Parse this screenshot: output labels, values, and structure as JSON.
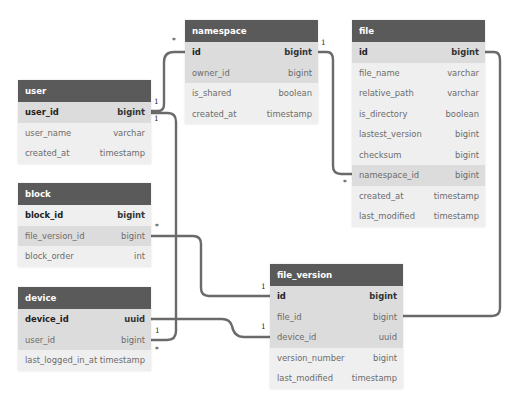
{
  "tables": {
    "user": {
      "title": "user",
      "columns": [
        {
          "name": "user_id",
          "type": "bigint"
        },
        {
          "name": "user_name",
          "type": "varchar"
        },
        {
          "name": "created_at",
          "type": "timestamp"
        }
      ]
    },
    "namespace": {
      "title": "namespace",
      "columns": [
        {
          "name": "id",
          "type": "bigint"
        },
        {
          "name": "owner_id",
          "type": "bigint"
        },
        {
          "name": "is_shared",
          "type": "boolean"
        },
        {
          "name": "created_at",
          "type": "timestamp"
        }
      ]
    },
    "file": {
      "title": "file",
      "columns": [
        {
          "name": "id",
          "type": "bigint"
        },
        {
          "name": "file_name",
          "type": "varchar"
        },
        {
          "name": "relative_path",
          "type": "varchar"
        },
        {
          "name": "is_directory",
          "type": "boolean"
        },
        {
          "name": "lastest_version",
          "type": "bigint"
        },
        {
          "name": "checksum",
          "type": "bigint"
        },
        {
          "name": "namespace_id",
          "type": "bigint"
        },
        {
          "name": "created_at",
          "type": "timestamp"
        },
        {
          "name": "last_modified",
          "type": "timestamp"
        }
      ]
    },
    "block": {
      "title": "block",
      "columns": [
        {
          "name": "block_id",
          "type": "bigint"
        },
        {
          "name": "file_version_id",
          "type": "bigint"
        },
        {
          "name": "block_order",
          "type": "int"
        }
      ]
    },
    "device": {
      "title": "device",
      "columns": [
        {
          "name": "device_id",
          "type": "uuid"
        },
        {
          "name": "user_id",
          "type": "bigint"
        },
        {
          "name": "last_logged_in_at",
          "type": "timestamp"
        }
      ]
    },
    "file_version": {
      "title": "file_version",
      "columns": [
        {
          "name": "id",
          "type": "bigint"
        },
        {
          "name": "file_id",
          "type": "bigint"
        },
        {
          "name": "device_id",
          "type": "uuid"
        },
        {
          "name": "version_number",
          "type": "bigint"
        },
        {
          "name": "last_modified",
          "type": "timestamp"
        }
      ]
    }
  },
  "relationships": [
    {
      "from": "user.user_id",
      "to": "namespace.id",
      "from_card": "1",
      "to_card": "*"
    },
    {
      "from": "namespace.id",
      "to": "file.namespace_id",
      "from_card": "1",
      "to_card": "*"
    },
    {
      "from": "user.user_id",
      "to": "device.user_id",
      "from_card": "1",
      "to_card": "*"
    },
    {
      "from": "file_version.id",
      "to": "block.file_version_id",
      "from_card": "1",
      "to_card": "*"
    },
    {
      "from": "device.device_id",
      "to": "file_version.device_id",
      "from_card": "1",
      "to_card": "1"
    },
    {
      "from": "file.id",
      "to": "file_version.file_id",
      "from_card": "",
      "to_card": ""
    }
  ],
  "cardinality": {
    "one": "1",
    "many": "*"
  },
  "colors": {
    "header_bg": "#5a5a5a",
    "row_bg": "#efefef",
    "row_highlight_bg": "#dcdcdc",
    "link": "#666666"
  }
}
